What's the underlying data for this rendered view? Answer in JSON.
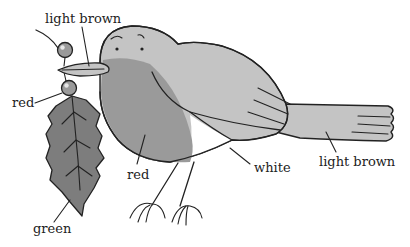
{
  "diagram": {
    "labels": {
      "beak": "light brown",
      "berry": "red",
      "breast": "red",
      "belly": "white",
      "tail": "light brown",
      "leaf": "green"
    },
    "fills": {
      "light_brown": "#c4c4c4",
      "red": "#9a9a9a",
      "green": "#7d7d7d",
      "white": "#ffffff",
      "outline": "#222222"
    }
  }
}
